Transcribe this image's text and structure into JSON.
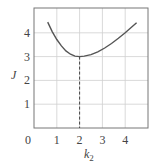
{
  "chart_data": {
    "type": "line",
    "title": "",
    "xlabel": "k",
    "xlabel_subscript": "2",
    "ylabel": "J",
    "xlim": [
      0,
      5
    ],
    "ylim": [
      0,
      5
    ],
    "grid": true,
    "legend": null,
    "x_ticks": [
      "0",
      "1",
      "2",
      "3",
      "4"
    ],
    "y_ticks": [
      "1",
      "2",
      "3",
      "4"
    ],
    "series": [
      {
        "name": "J(k2)",
        "x": [
          0.6,
          0.8,
          1.0,
          1.2,
          1.4,
          1.6,
          1.8,
          2.0,
          2.2,
          2.5,
          2.8,
          3.1,
          3.4,
          3.7,
          4.0,
          4.3,
          4.5
        ],
        "values": [
          4.45,
          4.05,
          3.72,
          3.45,
          3.24,
          3.1,
          3.02,
          3.0,
          3.02,
          3.08,
          3.2,
          3.36,
          3.55,
          3.77,
          4.0,
          4.25,
          4.42
        ]
      }
    ],
    "annotations": [
      {
        "type": "dashed-vertical-line",
        "x": 2,
        "from_y": 0,
        "to_y": 3,
        "note": "minimum at k2 = 2, J = 3"
      }
    ],
    "colors": {
      "curve": "#555555",
      "grid": "#cfcfcf",
      "frame": "#777777",
      "text": "#444444"
    }
  }
}
